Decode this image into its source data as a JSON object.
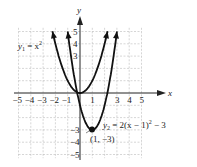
{
  "chart_data": {
    "type": "line",
    "title": "",
    "xlabel": "x",
    "ylabel": "y",
    "xlim": [
      -5,
      5
    ],
    "ylim": [
      -5,
      5
    ],
    "grid": true,
    "x_ticks": [
      "-5",
      "-4",
      "-3",
      "-2",
      "-1",
      "1",
      "3",
      "4",
      "5"
    ],
    "y_ticks": [
      "5",
      "4",
      "3",
      "-3",
      "-4",
      "-5"
    ],
    "series": [
      {
        "name": "y1 = x^2",
        "label_base": "y",
        "label_sub": "1",
        "label_rest": " = x",
        "label_sup": "2",
        "function": "x^2",
        "x_range": [
          -2.24,
          2.24
        ]
      },
      {
        "name": "y2 = 2(x - 1)^2 - 3",
        "label_base": "y",
        "label_sub": "2",
        "label_rest": " = 2(x − 1)",
        "label_sup": "2",
        "label_tail": " − 3",
        "function": "2(x-1)^2-3",
        "x_range": [
          -1,
          3
        ]
      }
    ],
    "annotations": [
      {
        "text": "(1, −3)",
        "x": 1,
        "y": -3,
        "type": "vertex-point"
      }
    ]
  }
}
